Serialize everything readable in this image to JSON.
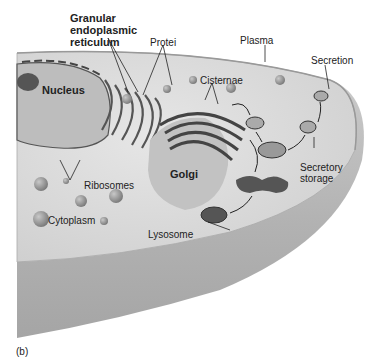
{
  "figure_label": "(b)",
  "labels": {
    "granular_er": [
      "Granular",
      "endoplasmic",
      "reticulum"
    ],
    "proteins": "Protei",
    "plasma": "Plasma",
    "secretion": "Secretion",
    "nucleus": "Nucleus",
    "cisternae": "Cisternae",
    "golgi": "Golgi",
    "ribosomes": "Ribosomes",
    "secretory_storage": [
      "Secretory",
      "storage"
    ],
    "cytoplasm": "Cytoplasm",
    "lysosome": "Lysosome"
  },
  "colors": {
    "cytoplasm_fill": "#d8d8d8",
    "cell_wall": "#b5b5b5",
    "organelle_dark": "#4a4a4a",
    "label_text": "#222222"
  }
}
